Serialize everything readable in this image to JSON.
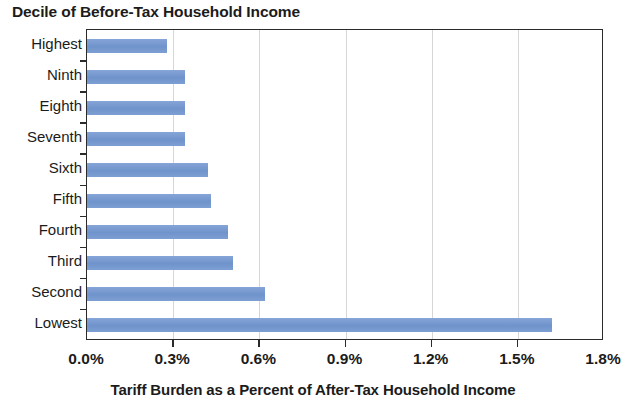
{
  "chart_data": {
    "type": "bar",
    "orientation": "horizontal",
    "title": "Decile of Before-Tax Household Income",
    "subtitle": "",
    "xlabel": "Tariff Burden as a Percent of After-Tax Household Income",
    "ylabel": "Decile of Before-Tax Household Income",
    "categories": [
      "Highest",
      "Ninth",
      "Eighth",
      "Seventh",
      "Sixth",
      "Fifth",
      "Fourth",
      "Third",
      "Second",
      "Lowest"
    ],
    "values": [
      0.28,
      0.34,
      0.34,
      0.34,
      0.42,
      0.43,
      0.49,
      0.51,
      0.62,
      1.62
    ],
    "value_unit": "%",
    "xlim": [
      0.0,
      1.8
    ],
    "xtick_values": [
      0.0,
      0.3,
      0.6,
      0.9,
      1.2,
      1.5,
      1.8
    ],
    "xtick_labels": [
      "0.0%",
      "0.3%",
      "0.6%",
      "0.9%",
      "1.2%",
      "1.5%",
      "1.8%"
    ],
    "grid": "vertical",
    "legend": "none",
    "bar_color": "#7597cf",
    "axis_color": "#2b2b2b",
    "gridline_color": "#d6d6d6",
    "plot_background": "#ffffff"
  }
}
